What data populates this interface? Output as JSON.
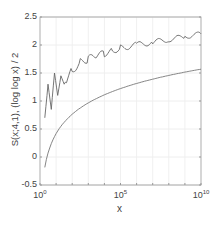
{
  "chart_data": {
    "type": "line",
    "title": "",
    "xlabel": "x",
    "ylabel": "S(x;4,1),  (log log x) / 2",
    "xscale": "log",
    "xlim": [
      1,
      10000000000
    ],
    "ylim": [
      -0.5,
      2.5
    ],
    "grid": true,
    "x_tick_labels": [
      {
        "base": "10",
        "exp": "0"
      },
      {
        "base": "10",
        "exp": "5"
      },
      {
        "base": "10",
        "exp": "10"
      }
    ],
    "y_tick_labels": [
      "2.5",
      "2",
      "1.5",
      "1",
      "0.5",
      "0",
      "-0.5"
    ],
    "y_ticks": [
      2.5,
      2,
      1.5,
      1,
      0.5,
      0,
      -0.5
    ],
    "legend": [],
    "series": [
      {
        "name": "S(x;4,1)",
        "style": "jagged",
        "color": "#666666",
        "log10_x": [
          0.3,
          0.5,
          0.7,
          0.9,
          1.1,
          1.3,
          1.5,
          2,
          2.5,
          3,
          3.5,
          4,
          4.5,
          5,
          6,
          7,
          8,
          9,
          10
        ],
        "values": [
          0.7,
          1.3,
          0.85,
          1.5,
          1.1,
          1.45,
          1.3,
          1.55,
          1.7,
          1.75,
          1.8,
          1.85,
          1.9,
          1.95,
          2.0,
          2.05,
          2.1,
          2.15,
          2.2
        ]
      },
      {
        "name": "(log log x) / 2",
        "style": "smooth",
        "color": "#777777",
        "log10_x": [
          0.3,
          0.5,
          1,
          2,
          3,
          4,
          5,
          6,
          7,
          8,
          9,
          10
        ],
        "values": [
          -0.18,
          0.07,
          0.42,
          0.76,
          0.97,
          1.11,
          1.22,
          1.31,
          1.39,
          1.46,
          1.52,
          1.57
        ]
      }
    ]
  }
}
